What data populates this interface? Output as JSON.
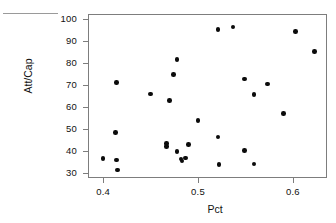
{
  "chart_data": {
    "type": "scatter",
    "title": "",
    "xlabel": "Pct",
    "ylabel": "Att/Cap",
    "xlim": [
      0.384,
      0.636
    ],
    "ylim": [
      27.5,
      102.5
    ],
    "xticks": [
      0.4,
      0.5,
      0.6
    ],
    "xticklabels": [
      "0.4",
      "0.5",
      "0.6"
    ],
    "yticks": [
      30,
      40,
      50,
      60,
      70,
      80,
      90,
      100
    ],
    "yticklabels": [
      "30",
      "40",
      "50",
      "60",
      "70",
      "80",
      "90",
      "100"
    ],
    "grid": false,
    "legend": null,
    "marker": "filled-circle",
    "marker_color": "#0b0b0b",
    "frame": true,
    "points": [
      {
        "x": 0.4,
        "y": 36.5
      },
      {
        "x": 0.414,
        "y": 35.8
      },
      {
        "x": 0.415,
        "y": 31.2
      },
      {
        "x": 0.413,
        "y": 48.4
      },
      {
        "x": 0.414,
        "y": 71.3
      },
      {
        "x": 0.45,
        "y": 66.0
      },
      {
        "x": 0.47,
        "y": 63.0
      },
      {
        "x": 0.467,
        "y": 43.3
      },
      {
        "x": 0.467,
        "y": 41.8
      },
      {
        "x": 0.474,
        "y": 74.8
      },
      {
        "x": 0.478,
        "y": 81.8
      },
      {
        "x": 0.478,
        "y": 39.6
      },
      {
        "x": 0.482,
        "y": 36.1
      },
      {
        "x": 0.483,
        "y": 35.2
      },
      {
        "x": 0.487,
        "y": 36.7
      },
      {
        "x": 0.49,
        "y": 42.8
      },
      {
        "x": 0.5,
        "y": 53.9
      },
      {
        "x": 0.521,
        "y": 95.4
      },
      {
        "x": 0.521,
        "y": 46.2
      },
      {
        "x": 0.522,
        "y": 33.6
      },
      {
        "x": 0.537,
        "y": 96.6
      },
      {
        "x": 0.549,
        "y": 72.8
      },
      {
        "x": 0.549,
        "y": 40.2
      },
      {
        "x": 0.559,
        "y": 65.8
      },
      {
        "x": 0.559,
        "y": 33.9
      },
      {
        "x": 0.573,
        "y": 70.4
      },
      {
        "x": 0.59,
        "y": 57.1
      },
      {
        "x": 0.603,
        "y": 94.4
      },
      {
        "x": 0.623,
        "y": 85.4
      }
    ]
  },
  "axes": {
    "x_title": "Pct",
    "y_title": "Att/Cap"
  }
}
